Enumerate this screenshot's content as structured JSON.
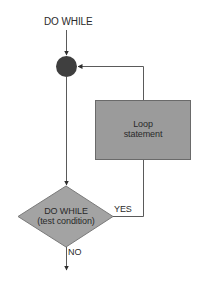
{
  "diagram": {
    "title": "DO WHILE",
    "nodes": {
      "junction": {
        "type": "connector-circle"
      },
      "loop": {
        "line1": "Loop",
        "line2": "statement"
      },
      "decision": {
        "line1": "DO WHILE",
        "line2": "(test condition)"
      }
    },
    "edges": {
      "yes_label": "YES",
      "no_label": "NO"
    },
    "colors": {
      "circle_fill": "#3f3f3f",
      "box_fill": "#9b9b9b",
      "diamond_fill": "#a3a3a3",
      "stroke": "#5a5a5a",
      "text": "#2a2a2a"
    }
  }
}
